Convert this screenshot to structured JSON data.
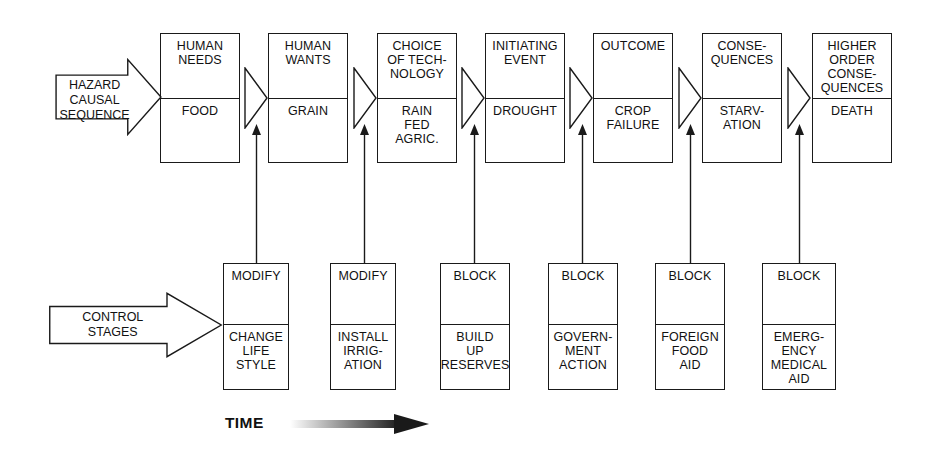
{
  "diagram": {
    "time_axis": {
      "label": "TIME",
      "label_x": 225,
      "label_y": 414,
      "arrow_x": 290,
      "arrow_y": 413,
      "arrow_width": 140,
      "arrow_height": 22,
      "gradient_from": "#ffffff",
      "gradient_to": "#1a1a1a"
    },
    "row_labels": [
      {
        "name": "hazard-causal-sequence-arrow",
        "text": "HAZARD\nCAUSAL\nSEQUENCE",
        "x": 55,
        "y": 58,
        "width": 107,
        "height": 78,
        "label_top": 20
      },
      {
        "name": "control-stages-arrow",
        "text": "CONTROL\nSTAGES",
        "x": 48,
        "y": 292,
        "width": 175,
        "height": 66,
        "label_top": 18
      }
    ],
    "top_row": {
      "name": "hazard-causal-sequence",
      "boxes": [
        {
          "head": "HUMAN\nNEEDS",
          "body": "FOOD",
          "x": 160,
          "width": 80
        },
        {
          "head": "HUMAN\nWANTS",
          "body": "GRAIN",
          "x": 268,
          "width": 80
        },
        {
          "head": "CHOICE\nOF TECH-\nNOLOGY",
          "body": "RAIN\nFED\nAGRIC.",
          "x": 377,
          "width": 80
        },
        {
          "head": "INITIATING\nEVENT",
          "body": "DROUGHT",
          "x": 485,
          "width": 80
        },
        {
          "head": "OUTCOME",
          "body": "CROP\nFAILURE",
          "x": 593,
          "width": 80
        },
        {
          "head": "CONSE-\nQUENCES",
          "body": "STARV-\nATION",
          "x": 702,
          "width": 80
        },
        {
          "head": "HIGHER\nORDER\nCONSE-\nQUENCES",
          "body": "DEATH",
          "x": 812,
          "width": 80
        }
      ],
      "chevrons": [
        {
          "x": 243
        },
        {
          "x": 352
        },
        {
          "x": 460
        },
        {
          "x": 568
        },
        {
          "x": 677
        },
        {
          "x": 786
        }
      ]
    },
    "bottom_row": {
      "name": "control-stages",
      "boxes": [
        {
          "head": "MODIFY",
          "body": "CHANGE\nLIFE\nSTYLE",
          "x": 223,
          "width": 66
        },
        {
          "head": "MODIFY",
          "body": "INSTALL\nIRRIG-\nATION",
          "x": 330,
          "width": 66
        },
        {
          "head": "BLOCK",
          "body": "BUILD\nUP\nRESERVES",
          "x": 440,
          "width": 70
        },
        {
          "head": "BLOCK",
          "body": "GOVERN-\nMENT\nACTION",
          "x": 548,
          "width": 70
        },
        {
          "head": "BLOCK",
          "body": "FOREIGN\nFOOD\nAID",
          "x": 655,
          "width": 70
        },
        {
          "head": "BLOCK",
          "body": "EMERG-\nENCY\nMEDICAL\nAID",
          "x": 762,
          "width": 74
        }
      ]
    },
    "connectors": [
      {
        "x": 250,
        "top": 124,
        "height": 140
      },
      {
        "x": 358,
        "top": 124,
        "height": 140
      },
      {
        "x": 468,
        "top": 124,
        "height": 140
      },
      {
        "x": 576,
        "top": 124,
        "height": 140
      },
      {
        "x": 684,
        "top": 124,
        "height": 140
      },
      {
        "x": 793,
        "top": 124,
        "height": 140
      }
    ],
    "colors": {
      "stroke": "#1a1a1a",
      "fill": "#ffffff",
      "text": "#111111"
    }
  }
}
